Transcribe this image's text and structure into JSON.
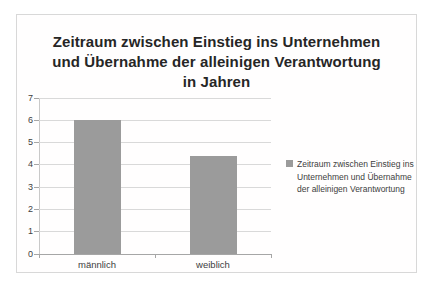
{
  "header_fragment": "in Jahren",
  "chart_data": {
    "type": "bar",
    "title": "Zeitraum zwischen Einstieg ins Unternehmen und Übernahme der alleinigen Verantwortung in Jahren",
    "title_lines": [
      "Zeitraum zwischen Einstieg ins Unternehmen",
      "und Übernahme der alleinigen Verantwortung",
      "in Jahren"
    ],
    "categories": [
      "männlich",
      "weiblich"
    ],
    "values": [
      6,
      4.4
    ],
    "xlabel": "",
    "ylabel": "",
    "ylim": [
      0,
      7
    ],
    "yticks": [
      0,
      1,
      2,
      3,
      4,
      5,
      6,
      7
    ],
    "grid": true,
    "legend": {
      "position": "right",
      "label": "Zeitraum zwischen Einstieg ins Unternehmen und Übernahme der alleinigen Verantwortung",
      "lines": [
        "Zeitraum zwischen Einstieg ins",
        "Unternehmen und Übernahme",
        "der alleinigen Verantwortung"
      ]
    },
    "colors": {
      "bar": "#9b9b9b",
      "gridline": "#d9d9d9",
      "axis": "#a6a6a6",
      "text": "#404040",
      "title": "#262626",
      "panel_border": "#d8d8d8"
    }
  }
}
